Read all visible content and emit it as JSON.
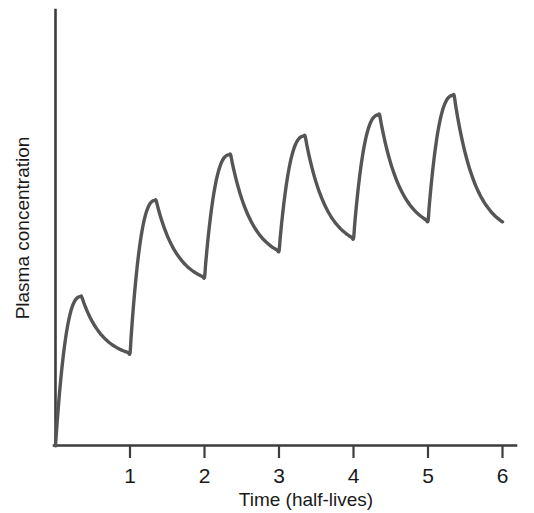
{
  "figure": {
    "background_color": "#ffffff",
    "axis_color": "#3d3d3d",
    "curve_color": "#555555",
    "text_color": "#1a1a1a"
  },
  "chart_data": {
    "type": "line",
    "title": "",
    "subtitle": "",
    "xlabel": "Time (half-lives)",
    "ylabel": "Plasma concentration",
    "xlim": [
      0,
      6.2
    ],
    "ylim": [
      0,
      1.0
    ],
    "grid": false,
    "legend": null,
    "x_ticks": [
      1,
      2,
      3,
      4,
      5,
      6
    ],
    "x_tick_labels": [
      "1",
      "2",
      "3",
      "4",
      "5",
      "6"
    ],
    "y_ticks": [],
    "y_tick_labels": [],
    "annotations": [],
    "series": [
      {
        "name": "Plasma concentration",
        "color": "#555555",
        "line_width": 3.4,
        "description": "Repeated-dose accumulation: sawtooth rise to steady state over 6 half-lives",
        "peaks": [
          {
            "x": 0.35,
            "y": 0.352
          },
          {
            "x": 1.35,
            "y": 0.579
          },
          {
            "x": 2.35,
            "y": 0.687
          },
          {
            "x": 3.35,
            "y": 0.731
          },
          {
            "x": 4.35,
            "y": 0.781
          },
          {
            "x": 5.35,
            "y": 0.827
          }
        ],
        "troughs": [
          {
            "x": 0.0,
            "y": 0.0
          },
          {
            "x": 1.0,
            "y": 0.218
          },
          {
            "x": 2.0,
            "y": 0.397
          },
          {
            "x": 3.0,
            "y": 0.459
          },
          {
            "x": 4.0,
            "y": 0.489
          },
          {
            "x": 5.0,
            "y": 0.53
          },
          {
            "x": 6.0,
            "y": 0.528
          }
        ],
        "x": [
          0,
          0.35,
          1.0,
          1.35,
          2.0,
          2.35,
          3.0,
          3.35,
          4.0,
          4.35,
          5.0,
          5.35,
          6.0
        ],
        "y": [
          0.0,
          0.352,
          0.218,
          0.579,
          0.397,
          0.687,
          0.459,
          0.731,
          0.489,
          0.781,
          0.53,
          0.827,
          0.528
        ]
      }
    ]
  },
  "axes": {
    "x_axis_name": "time-axis",
    "y_axis_name": "concentration-axis"
  }
}
